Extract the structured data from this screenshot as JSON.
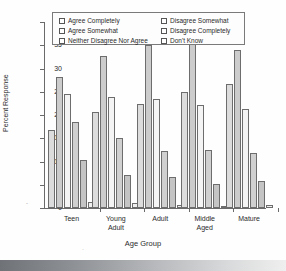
{
  "chart_data": {
    "type": "bar",
    "title": "",
    "xlabel": "Age Group",
    "ylabel": "Percent Response",
    "ylim": [
      0,
      40
    ],
    "yticks": [
      0,
      5,
      10,
      15,
      20,
      25,
      30,
      35,
      40
    ],
    "grid": false,
    "legend_position": "top-inside",
    "categories": [
      "Teen",
      "Young Adult",
      "Adult",
      "Middle Aged",
      "Mature"
    ],
    "category_lines": [
      [
        "Teen"
      ],
      [
        "Young",
        "Adult"
      ],
      [
        "Adult"
      ],
      [
        "Middle",
        "Aged"
      ],
      [
        "Mature"
      ]
    ],
    "series": [
      {
        "name": "Agree Completely",
        "values": [
          16.8,
          20.6,
          22.3,
          25.0,
          26.7
        ]
      },
      {
        "name": "Agree Somewhat",
        "values": [
          28.1,
          32.7,
          35.0,
          35.3,
          33.9
        ]
      },
      {
        "name": "Neither Disagree Nor Agree",
        "values": [
          24.5,
          23.9,
          23.4,
          22.1,
          21.2
        ]
      },
      {
        "name": "Disagree Somewhat",
        "values": [
          18.5,
          15.0,
          12.2,
          12.4,
          11.8
        ]
      },
      {
        "name": "Disagree Completely",
        "values": [
          10.3,
          7.0,
          6.7,
          5.1,
          5.9
        ]
      },
      {
        "name": "Don't Know",
        "values": [
          1.4,
          1.0,
          0.7,
          0.4,
          0.6
        ]
      }
    ]
  },
  "legend": {
    "column_left": [
      "Agree Completely",
      "Agree Somewhat",
      "Neither Disagree Nor Agree"
    ],
    "column_right": [
      "Disagree Somewhat",
      "Disagree Completely",
      "Don't Know"
    ]
  },
  "axes": {
    "y_title": "Percent Response",
    "x_title": "Age Group",
    "y_tick_labels": [
      "0",
      "5",
      "10",
      "15",
      "20",
      "25",
      "30",
      "35",
      "40"
    ]
  }
}
